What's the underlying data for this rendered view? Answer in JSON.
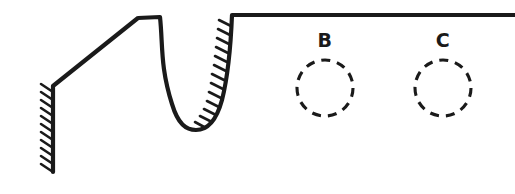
{
  "figure": {
    "background_color": "#ffffff",
    "ink_color": "#1a1a1a",
    "canvas": {
      "width": 515,
      "height": 194
    },
    "profile": {
      "name": "part-outline",
      "description": "Sectioned profile: left hatched vertical wall, diagonal ramp, flat crest, U-shaped groove with hatched right flank, long flat top land extending to right edge",
      "path": "M 53 172 L 53 86 L 138 18 L 160 17 C 163 45, 160 66, 172 104 C 178 124, 186 130, 196 130 C 207 130, 216 122, 222 100 C 229 72, 231 40, 232 15 L 515 15",
      "stroke_width": 4.2
    },
    "hatching": [
      {
        "name": "left-wall-hatching",
        "side": "left",
        "from": {
          "x": 53,
          "y": 90
        },
        "to": {
          "x": 53,
          "y": 170
        },
        "tick_count": 11,
        "tick_length": 13,
        "tick_angle_deg": 35
      },
      {
        "name": "groove-right-flank-hatching",
        "side": "left",
        "tick_count": 13,
        "tick_length": 13,
        "tick_angle_deg": 35
      }
    ],
    "holes": [
      {
        "id": "hole-b",
        "label": "B",
        "style": "dashed-circle",
        "center": {
          "x": 325,
          "y": 88
        },
        "radius": 28,
        "label_position": {
          "x": 325,
          "y": 47
        }
      },
      {
        "id": "hole-c",
        "label": "C",
        "style": "dashed-circle",
        "center": {
          "x": 443,
          "y": 88
        },
        "radius": 28,
        "label_position": {
          "x": 443,
          "y": 47
        }
      }
    ]
  }
}
